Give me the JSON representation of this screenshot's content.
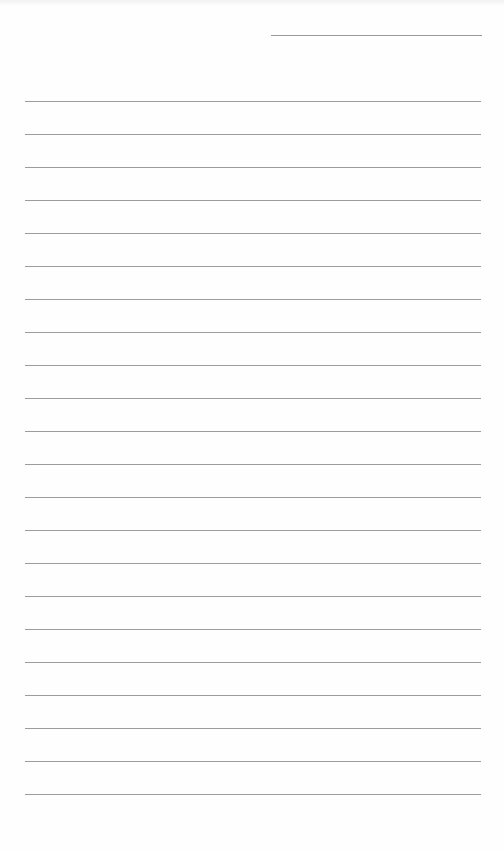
{
  "document": {
    "type": "lined-paper",
    "header_line": {
      "left": 271,
      "top": 35,
      "width": 211
    },
    "ruled_lines": {
      "count": 22,
      "first_top": 101,
      "spacing": 33,
      "left": 25,
      "width": 456,
      "color": "#9c9c9c"
    },
    "background_color": "#fefefe"
  }
}
